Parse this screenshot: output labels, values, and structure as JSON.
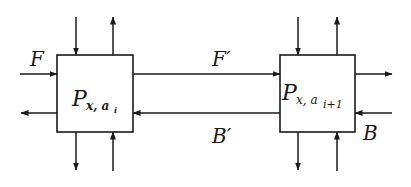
{
  "diagram": {
    "colors": {
      "stroke": "#1a1a1a",
      "background": "#ffffff"
    },
    "nodes": [
      {
        "id": "left",
        "label_main": "P",
        "label_sub": "x, a",
        "label_subsub": "i"
      },
      {
        "id": "right",
        "label_main": "P",
        "label_sub": "x, a",
        "label_subsub": "i+1"
      }
    ],
    "edge_labels": {
      "F": "F",
      "F_prime": "F′",
      "B_prime": "B′",
      "B": "B"
    },
    "edges": [
      {
        "from": "external",
        "to": "left",
        "label": "F"
      },
      {
        "from": "left",
        "to": "external",
        "label": ""
      },
      {
        "from": "left",
        "to": "right",
        "label": "F′"
      },
      {
        "from": "right",
        "to": "left",
        "label": "B′"
      },
      {
        "from": "right",
        "to": "external",
        "label": ""
      },
      {
        "from": "external",
        "to": "right",
        "label": "B"
      },
      {
        "from": "external-top",
        "to": "left",
        "label": ""
      },
      {
        "from": "left",
        "to": "external-top",
        "label": ""
      },
      {
        "from": "left",
        "to": "external-bottom",
        "label": ""
      },
      {
        "from": "external-bottom",
        "to": "left",
        "label": ""
      },
      {
        "from": "external-top",
        "to": "right",
        "label": ""
      },
      {
        "from": "right",
        "to": "external-top",
        "label": ""
      },
      {
        "from": "right",
        "to": "external-bottom",
        "label": ""
      },
      {
        "from": "external-bottom",
        "to": "right",
        "label": ""
      }
    ]
  }
}
